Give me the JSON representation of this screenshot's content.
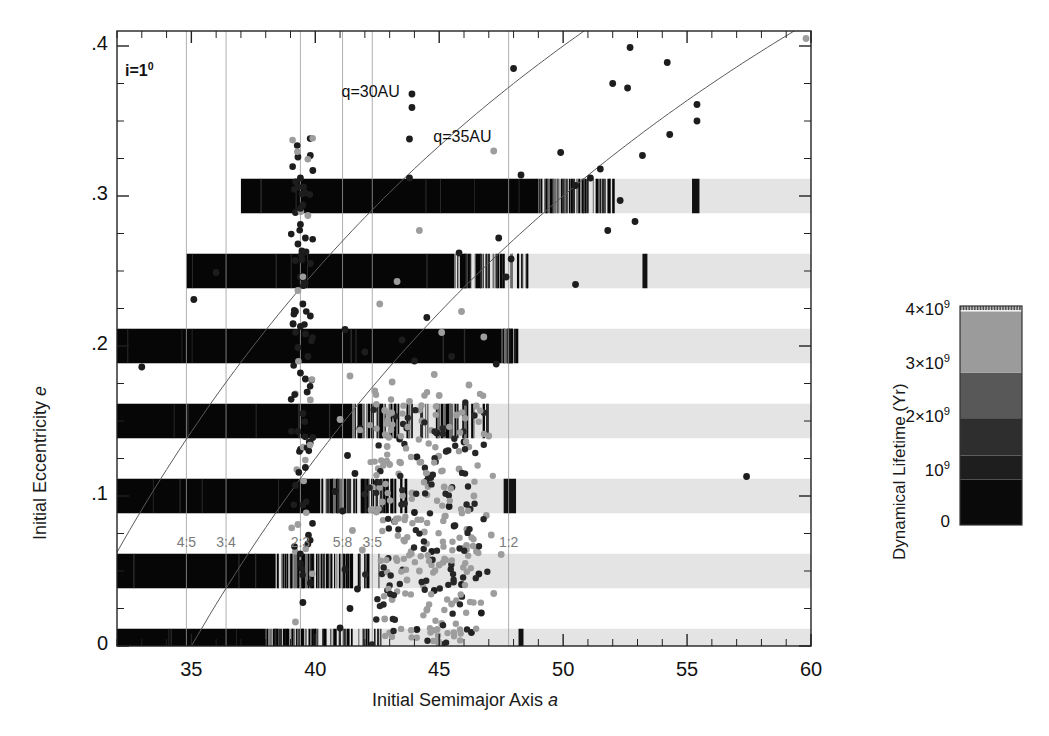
{
  "figure": {
    "inclination_note": "i=1",
    "inclination_sup": "0"
  },
  "axes": {
    "xlabel_prefix": "Initial Semimajor Axis ",
    "xlabel_italic": "a",
    "ylabel_prefix": "Initial Eccentricity ",
    "ylabel_italic": "e",
    "xticks": [
      35,
      40,
      45,
      50,
      55,
      60
    ],
    "xtick_labels": [
      "35",
      "40",
      "45",
      "50",
      "55",
      "60"
    ],
    "xlim": [
      32,
      60
    ],
    "yticks": [
      0,
      0.1,
      0.2,
      0.3,
      0.4
    ],
    "ytick_labels": [
      "0",
      ".1",
      ".2",
      ".3",
      ".4"
    ],
    "ylim": [
      0,
      0.41
    ],
    "x_minor_step": 1,
    "y_minor_step": 0.025
  },
  "annotations": [
    {
      "name": "q30-label",
      "text": "q=30AU",
      "a": 43.4,
      "e": 0.368
    },
    {
      "name": "q35-label",
      "text": "q=35AU",
      "a": 47.1,
      "e": 0.338
    }
  ],
  "resonances": [
    {
      "label": "4:5",
      "a": 34.8
    },
    {
      "label": "3:4",
      "a": 36.4
    },
    {
      "label": "2:3",
      "a": 39.4
    },
    {
      "label": "5:8",
      "a": 41.1
    },
    {
      "label": "3:5",
      "a": 42.3
    },
    {
      "label": "1:2",
      "a": 47.8
    }
  ],
  "resonance_gridlines": [
    34.8,
    36.4,
    39.4,
    41.1,
    42.3,
    47.8
  ],
  "perihelion_curves": [
    {
      "name": "q=30AU",
      "q": 30
    },
    {
      "name": "q=35AU",
      "q": 35
    }
  ],
  "colorbar": {
    "title": "Dynamical Lifetime (Yr)",
    "ticks": [
      0,
      1,
      2,
      3,
      4
    ],
    "tick_labels": [
      "0",
      "10",
      "2×10",
      "3×10",
      "4×10"
    ],
    "tick_exponent": "9",
    "range": [
      0,
      4.1
    ],
    "bands": [
      {
        "from": 0.0,
        "to": 0.85,
        "color": "#0a0a0a"
      },
      {
        "from": 0.85,
        "to": 1.3,
        "color": "#1e1e1e"
      },
      {
        "from": 1.3,
        "to": 2.0,
        "color": "#2e2e2e"
      },
      {
        "from": 2.0,
        "to": 2.85,
        "color": "#585858"
      },
      {
        "from": 2.85,
        "to": 4.0,
        "color": "#9b9b9b"
      },
      {
        "from": 4.0,
        "to": 4.08,
        "color": "#efefef"
      }
    ]
  },
  "chart_data": {
    "type": "scatter",
    "title": "",
    "xlabel": "Initial Semimajor Axis a",
    "ylabel": "Initial Eccentricity e",
    "xlim": [
      32,
      60
    ],
    "ylim": [
      0,
      0.41
    ],
    "grid": "vertical-resonance-lines-only",
    "legend": "colorbar: Dynamical Lifetime (Yr), 0 to 4x10^9",
    "strip_half_height_e": 0.0115,
    "strips": [
      {
        "e": 0.3,
        "a_start": 37.0,
        "a_end": 60.0,
        "segments": [
          {
            "a0": 37.0,
            "a1": 49.0,
            "fill": "solid-black"
          },
          {
            "a0": 49.0,
            "a1": 52.2,
            "fill": "striped"
          },
          {
            "a0": 52.2,
            "a1": 60.0,
            "fill": "light"
          },
          {
            "a0": 55.2,
            "a1": 55.5,
            "fill": "dark-bar"
          }
        ]
      },
      {
        "e": 0.25,
        "a_start": 34.8,
        "a_end": 60.0,
        "segments": [
          {
            "a0": 34.8,
            "a1": 45.6,
            "fill": "solid-black"
          },
          {
            "a0": 45.6,
            "a1": 48.6,
            "fill": "striped"
          },
          {
            "a0": 48.6,
            "a1": 60.0,
            "fill": "light"
          },
          {
            "a0": 53.2,
            "a1": 53.4,
            "fill": "dark-bar"
          }
        ]
      },
      {
        "e": 0.2,
        "a_start": 32.0,
        "a_end": 60.0,
        "segments": [
          {
            "a0": 32.0,
            "a1": 47.5,
            "fill": "solid-black"
          },
          {
            "a0": 47.5,
            "a1": 48.1,
            "fill": "striped"
          },
          {
            "a0": 48.1,
            "a1": 60.0,
            "fill": "light"
          }
        ]
      },
      {
        "e": 0.15,
        "a_start": 32.0,
        "a_end": 60.0,
        "segments": [
          {
            "a0": 32.0,
            "a1": 41.5,
            "fill": "solid-black"
          },
          {
            "a0": 41.5,
            "a1": 47.0,
            "fill": "striped"
          },
          {
            "a0": 47.0,
            "a1": 60.0,
            "fill": "light"
          }
        ]
      },
      {
        "e": 0.1,
        "a_start": 32.0,
        "a_end": 60.0,
        "segments": [
          {
            "a0": 32.0,
            "a1": 40.2,
            "fill": "solid-black"
          },
          {
            "a0": 40.2,
            "a1": 44.0,
            "fill": "striped"
          },
          {
            "a0": 44.0,
            "a1": 60.0,
            "fill": "light"
          },
          {
            "a0": 47.6,
            "a1": 48.1,
            "fill": "dark-bar"
          }
        ]
      },
      {
        "e": 0.05,
        "a_start": 32.0,
        "a_end": 60.0,
        "segments": [
          {
            "a0": 32.0,
            "a1": 38.4,
            "fill": "solid-black"
          },
          {
            "a0": 38.4,
            "a1": 42.6,
            "fill": "striped"
          },
          {
            "a0": 42.6,
            "a1": 60.0,
            "fill": "light"
          }
        ]
      },
      {
        "e": 0.0,
        "a_start": 32.0,
        "a_end": 60.0,
        "segments": [
          {
            "a0": 32.0,
            "a1": 38.0,
            "fill": "solid-black"
          },
          {
            "a0": 38.0,
            "a1": 42.7,
            "fill": "striped"
          },
          {
            "a0": 42.7,
            "a1": 60.0,
            "fill": "light"
          },
          {
            "a0": 48.2,
            "a1": 48.4,
            "fill": "dark-bar"
          }
        ]
      }
    ],
    "objects_note": "Scattered overplotted points (known TNOs): dark = classical/low-lifetime region, grey = long-lived region.",
    "points": [
      {
        "a": 59.8,
        "e": 0.405
      },
      {
        "a": 52.7,
        "e": 0.399
      },
      {
        "a": 54.2,
        "e": 0.389
      },
      {
        "a": 52.0,
        "e": 0.375
      },
      {
        "a": 52.6,
        "e": 0.372
      },
      {
        "a": 48.0,
        "e": 0.385
      },
      {
        "a": 43.9,
        "e": 0.368
      },
      {
        "a": 43.9,
        "e": 0.359
      },
      {
        "a": 55.4,
        "e": 0.361
      },
      {
        "a": 55.4,
        "e": 0.35
      },
      {
        "a": 54.3,
        "e": 0.341
      },
      {
        "a": 47.2,
        "e": 0.33
      },
      {
        "a": 43.8,
        "e": 0.338
      },
      {
        "a": 53.2,
        "e": 0.327
      },
      {
        "a": 49.9,
        "e": 0.329
      },
      {
        "a": 51.5,
        "e": 0.318
      },
      {
        "a": 39.3,
        "e": 0.326
      },
      {
        "a": 39.8,
        "e": 0.327
      },
      {
        "a": 39.9,
        "e": 0.317
      },
      {
        "a": 39.4,
        "e": 0.312
      },
      {
        "a": 39.3,
        "e": 0.306
      },
      {
        "a": 39.6,
        "e": 0.302
      },
      {
        "a": 50.5,
        "e": 0.307
      },
      {
        "a": 51.1,
        "e": 0.312
      },
      {
        "a": 48.3,
        "e": 0.314
      },
      {
        "a": 43.8,
        "e": 0.312
      },
      {
        "a": 52.3,
        "e": 0.297
      },
      {
        "a": 39.5,
        "e": 0.294
      },
      {
        "a": 39.2,
        "e": 0.289
      },
      {
        "a": 39.7,
        "e": 0.287
      },
      {
        "a": 52.9,
        "e": 0.283
      },
      {
        "a": 51.8,
        "e": 0.277
      },
      {
        "a": 39.4,
        "e": 0.281
      },
      {
        "a": 39.6,
        "e": 0.272
      },
      {
        "a": 39.3,
        "e": 0.268
      },
      {
        "a": 44.2,
        "e": 0.277
      },
      {
        "a": 47.4,
        "e": 0.272
      },
      {
        "a": 39.5,
        "e": 0.262
      },
      {
        "a": 39.2,
        "e": 0.257
      },
      {
        "a": 39.8,
        "e": 0.255
      },
      {
        "a": 45.8,
        "e": 0.262
      },
      {
        "a": 47.9,
        "e": 0.258
      },
      {
        "a": 36.0,
        "e": 0.249
      },
      {
        "a": 39.4,
        "e": 0.246
      },
      {
        "a": 39.6,
        "e": 0.242
      },
      {
        "a": 39.3,
        "e": 0.237
      },
      {
        "a": 43.3,
        "e": 0.243
      },
      {
        "a": 47.7,
        "e": 0.246
      },
      {
        "a": 50.5,
        "e": 0.241
      },
      {
        "a": 35.1,
        "e": 0.231
      },
      {
        "a": 39.5,
        "e": 0.228
      },
      {
        "a": 39.2,
        "e": 0.223
      },
      {
        "a": 39.8,
        "e": 0.22
      },
      {
        "a": 42.6,
        "e": 0.228
      },
      {
        "a": 44.5,
        "e": 0.219
      },
      {
        "a": 45.9,
        "e": 0.223
      },
      {
        "a": 39.4,
        "e": 0.213
      },
      {
        "a": 39.6,
        "e": 0.208
      },
      {
        "a": 41.2,
        "e": 0.211
      },
      {
        "a": 43.5,
        "e": 0.204
      },
      {
        "a": 45.1,
        "e": 0.209
      },
      {
        "a": 46.8,
        "e": 0.206
      },
      {
        "a": 39.3,
        "e": 0.199
      },
      {
        "a": 39.7,
        "e": 0.193
      },
      {
        "a": 42.0,
        "e": 0.196
      },
      {
        "a": 44.0,
        "e": 0.19
      },
      {
        "a": 45.5,
        "e": 0.193
      },
      {
        "a": 47.3,
        "e": 0.188
      },
      {
        "a": 33.0,
        "e": 0.186
      },
      {
        "a": 39.4,
        "e": 0.182
      },
      {
        "a": 39.6,
        "e": 0.178
      },
      {
        "a": 41.4,
        "e": 0.18
      },
      {
        "a": 43.1,
        "e": 0.176
      },
      {
        "a": 44.8,
        "e": 0.181
      },
      {
        "a": 46.2,
        "e": 0.174
      },
      {
        "a": 39.2,
        "e": 0.168
      },
      {
        "a": 39.8,
        "e": 0.164
      },
      {
        "a": 42.4,
        "e": 0.17
      },
      {
        "a": 43.8,
        "e": 0.163
      },
      {
        "a": 45.0,
        "e": 0.167
      },
      {
        "a": 46.5,
        "e": 0.16
      },
      {
        "a": 39.5,
        "e": 0.155
      },
      {
        "a": 41.0,
        "e": 0.151
      },
      {
        "a": 42.8,
        "e": 0.157
      },
      {
        "a": 44.3,
        "e": 0.15
      },
      {
        "a": 45.7,
        "e": 0.154
      },
      {
        "a": 39.3,
        "e": 0.143
      },
      {
        "a": 39.9,
        "e": 0.139
      },
      {
        "a": 41.8,
        "e": 0.145
      },
      {
        "a": 43.4,
        "e": 0.138
      },
      {
        "a": 44.9,
        "e": 0.142
      },
      {
        "a": 46.0,
        "e": 0.136
      },
      {
        "a": 47.0,
        "e": 0.14
      },
      {
        "a": 39.4,
        "e": 0.131
      },
      {
        "a": 41.3,
        "e": 0.127
      },
      {
        "a": 42.9,
        "e": 0.133
      },
      {
        "a": 44.1,
        "e": 0.126
      },
      {
        "a": 45.3,
        "e": 0.13
      },
      {
        "a": 57.4,
        "e": 0.113
      },
      {
        "a": 39.6,
        "e": 0.119
      },
      {
        "a": 41.6,
        "e": 0.115
      },
      {
        "a": 43.0,
        "e": 0.121
      },
      {
        "a": 44.6,
        "e": 0.114
      },
      {
        "a": 45.8,
        "e": 0.118
      },
      {
        "a": 39.2,
        "e": 0.107
      },
      {
        "a": 40.8,
        "e": 0.103
      },
      {
        "a": 42.5,
        "e": 0.109
      },
      {
        "a": 43.9,
        "e": 0.102
      },
      {
        "a": 45.2,
        "e": 0.106
      },
      {
        "a": 46.4,
        "e": 0.1
      },
      {
        "a": 39.5,
        "e": 0.094
      },
      {
        "a": 41.1,
        "e": 0.09
      },
      {
        "a": 42.7,
        "e": 0.096
      },
      {
        "a": 44.0,
        "e": 0.089
      },
      {
        "a": 45.4,
        "e": 0.093
      },
      {
        "a": 46.9,
        "e": 0.087
      },
      {
        "a": 39.3,
        "e": 0.081
      },
      {
        "a": 41.5,
        "e": 0.077
      },
      {
        "a": 43.2,
        "e": 0.083
      },
      {
        "a": 44.4,
        "e": 0.076
      },
      {
        "a": 45.6,
        "e": 0.08
      },
      {
        "a": 47.1,
        "e": 0.074
      },
      {
        "a": 39.7,
        "e": 0.068
      },
      {
        "a": 41.9,
        "e": 0.064
      },
      {
        "a": 43.6,
        "e": 0.07
      },
      {
        "a": 44.7,
        "e": 0.063
      },
      {
        "a": 46.1,
        "e": 0.067
      },
      {
        "a": 47.5,
        "e": 0.061
      },
      {
        "a": 39.4,
        "e": 0.055
      },
      {
        "a": 41.2,
        "e": 0.051
      },
      {
        "a": 43.3,
        "e": 0.057
      },
      {
        "a": 44.2,
        "e": 0.05
      },
      {
        "a": 45.0,
        "e": 0.054
      },
      {
        "a": 46.6,
        "e": 0.048
      },
      {
        "a": 39.8,
        "e": 0.042
      },
      {
        "a": 41.7,
        "e": 0.038
      },
      {
        "a": 43.7,
        "e": 0.044
      },
      {
        "a": 44.8,
        "e": 0.037
      },
      {
        "a": 45.9,
        "e": 0.041
      },
      {
        "a": 47.2,
        "e": 0.035
      },
      {
        "a": 39.5,
        "e": 0.029
      },
      {
        "a": 41.4,
        "e": 0.025
      },
      {
        "a": 43.1,
        "e": 0.031
      },
      {
        "a": 44.5,
        "e": 0.024
      },
      {
        "a": 45.5,
        "e": 0.028
      },
      {
        "a": 46.7,
        "e": 0.022
      },
      {
        "a": 39.2,
        "e": 0.016
      },
      {
        "a": 41.0,
        "e": 0.012
      },
      {
        "a": 42.8,
        "e": 0.018
      },
      {
        "a": 44.1,
        "e": 0.011
      },
      {
        "a": 45.1,
        "e": 0.015
      },
      {
        "a": 46.3,
        "e": 0.009
      }
    ]
  }
}
